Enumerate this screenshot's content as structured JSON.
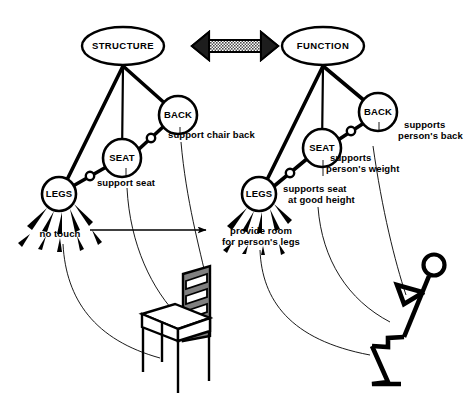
{
  "diagram": {
    "background_color": "#ffffff",
    "ink_color": "#000000",
    "shade_color": "#808080"
  },
  "panels": {
    "left": {
      "root_label": "STRUCTURE",
      "nodes": [
        {
          "id": "legs",
          "label": "LEGS",
          "cx": 59,
          "cy": 194,
          "r": 17
        },
        {
          "id": "seat",
          "label": "SEAT",
          "cx": 122,
          "cy": 158,
          "r": 19
        },
        {
          "id": "back",
          "label": "BACK",
          "cx": 178,
          "cy": 115,
          "r": 19
        }
      ],
      "root_ellipse": {
        "cx": 123,
        "cy": 46,
        "rx": 41,
        "ry": 19
      },
      "annotations": [
        {
          "id": "legs-anno",
          "text": "no touch",
          "x": 60,
          "y": 234,
          "anchor": "mid"
        },
        {
          "id": "seat-anno",
          "text": "support seat",
          "x": 126,
          "y": 183,
          "anchor": "mid"
        },
        {
          "id": "back-anno",
          "text": "support chair back",
          "x": 168,
          "y": 135,
          "anchor": "start"
        }
      ]
    },
    "right": {
      "root_label": "FUNCTION",
      "nodes": [
        {
          "id": "legs",
          "label": "LEGS",
          "cx": 259,
          "cy": 194,
          "r": 17
        },
        {
          "id": "seat",
          "label": "SEAT",
          "cx": 322,
          "cy": 148,
          "r": 19
        },
        {
          "id": "back",
          "label": "BACK",
          "cx": 378,
          "cy": 112,
          "r": 19
        }
      ],
      "root_ellipse": {
        "cx": 323,
        "cy": 46,
        "rx": 41,
        "ry": 19
      },
      "annotations": [
        {
          "id": "legs-anno-line1",
          "text": "provide room",
          "x": 261,
          "y": 231,
          "anchor": "mid"
        },
        {
          "id": "legs-anno-line2",
          "text": "for person's legs",
          "x": 261,
          "y": 242,
          "anchor": "mid"
        },
        {
          "id": "seat-anno-line1",
          "text": "supports seat",
          "x": 283,
          "y": 189,
          "anchor": "start"
        },
        {
          "id": "seat-anno-line2",
          "text": "at good height",
          "x": 288,
          "y": 200,
          "anchor": "start"
        },
        {
          "id": "weight-anno-line1",
          "text": "supports",
          "x": 330,
          "y": 158,
          "anchor": "start"
        },
        {
          "id": "weight-anno-line2",
          "text": "person's weight",
          "x": 326,
          "y": 169,
          "anchor": "start"
        },
        {
          "id": "back-anno-line1",
          "text": "supports",
          "x": 404,
          "y": 125,
          "anchor": "start"
        },
        {
          "id": "back-anno-line2",
          "text": "person's back",
          "x": 398,
          "y": 136,
          "anchor": "start"
        }
      ]
    }
  },
  "connectors": {
    "double_arrow_label": "structure-function-correspondence",
    "mapping_arrow_label": "legs-mapping-arrow"
  },
  "illustrations": {
    "chair": "perspective-chair-with-slatted-back",
    "person": "stick-figure-person-seated"
  }
}
